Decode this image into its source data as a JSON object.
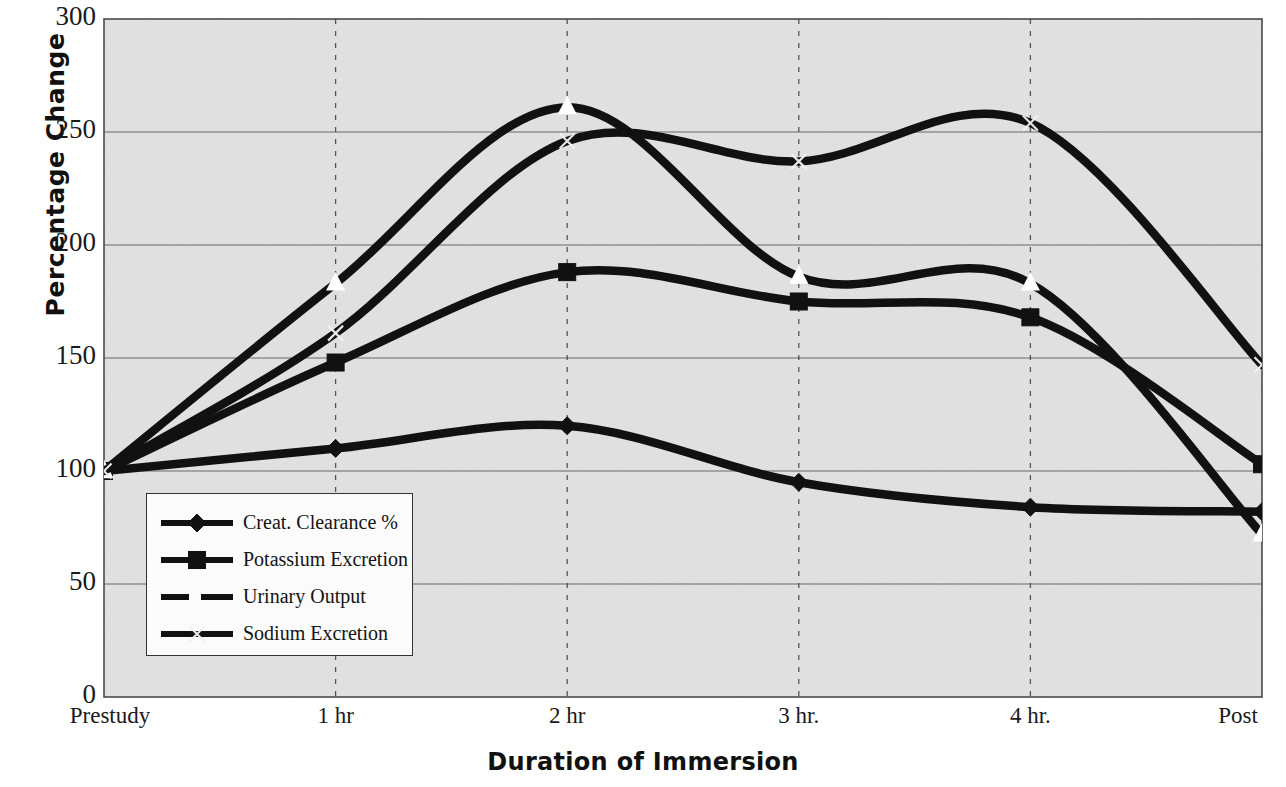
{
  "chart_data": {
    "type": "line",
    "title": "",
    "xlabel": "Duration of Immersion",
    "ylabel": "Percentage Change",
    "categories": [
      "Prestudy",
      "1 hr",
      "2 hr",
      "3 hr.",
      "4 hr.",
      "Post"
    ],
    "xtick_labels": [
      "Prestudy",
      "1 hr",
      "2 hr",
      "3 hr.",
      "4 hr.",
      "Post"
    ],
    "ytick_labels": [
      "0",
      "50",
      "100",
      "150",
      "200",
      "250",
      "300"
    ],
    "ytick_values": [
      0,
      50,
      100,
      150,
      200,
      250,
      300
    ],
    "ylim": [
      0,
      300
    ],
    "grid": "horizontal-solid-and-vertical-dashed",
    "legend_position": "inside-lower-left",
    "series": [
      {
        "name": "Creat. Clearance %",
        "marker": "diamond",
        "line_style": "solid",
        "values": [
          100,
          110,
          120,
          95,
          84,
          82
        ]
      },
      {
        "name": "Potassium Excretion",
        "marker": "square",
        "line_style": "solid",
        "values": [
          100,
          148,
          188,
          175,
          168,
          103
        ]
      },
      {
        "name": "Urinary Output",
        "marker": "triangle",
        "line_style": "solid",
        "values": [
          100,
          183,
          261,
          186,
          183,
          72
        ]
      },
      {
        "name": "Sodium Excretion",
        "marker": "x",
        "line_style": "solid",
        "values": [
          100,
          161,
          246,
          237,
          254,
          147
        ]
      }
    ]
  },
  "axes": {
    "y_title": "Percentage Change",
    "x_title": "Duration of Immersion"
  },
  "legend": {
    "items": [
      {
        "label": "Creat. Clearance %",
        "marker": "diamond-marker"
      },
      {
        "label": "Potassium Excretion",
        "marker": "square-marker"
      },
      {
        "label": "Urinary Output",
        "marker": "dashed-line-marker"
      },
      {
        "label": "Sodium Excretion",
        "marker": "x-marker"
      }
    ]
  },
  "colors": {
    "line": "#111111",
    "plot_background": "#e9e9e9",
    "gridline": "#555555",
    "axis": "#444444",
    "marker_fill_open": "#ffffff"
  }
}
